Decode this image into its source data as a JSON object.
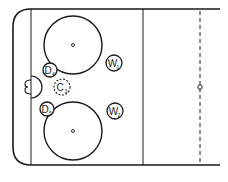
{
  "diagram": {
    "type": "hockey-rink-half-zone",
    "colors": {
      "line": "#1a1a1a",
      "background": "#ffffff"
    },
    "players": [
      {
        "id": "D4",
        "letter": "D",
        "sub": "4",
        "x": 50,
        "y": 70,
        "dashed": false
      },
      {
        "id": "C3",
        "letter": "C",
        "sub": "3",
        "x": 62,
        "y": 87,
        "dashed": true
      },
      {
        "id": "D5",
        "letter": "D",
        "sub": "5",
        "x": 47,
        "y": 109,
        "dashed": false
      },
      {
        "id": "W1",
        "letter": "W",
        "sub": "1",
        "x": 114,
        "y": 63,
        "dashed": false
      },
      {
        "id": "W2",
        "letter": "W",
        "sub": "2",
        "x": 115,
        "y": 111,
        "dashed": false
      }
    ],
    "faceoff_circles": [
      {
        "name": "upper",
        "cx": 73,
        "cy": 45,
        "r": 29
      },
      {
        "name": "lower",
        "cx": 73,
        "cy": 131,
        "r": 29
      }
    ]
  }
}
